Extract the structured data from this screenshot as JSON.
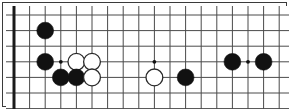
{
  "figure": {
    "kind": "go-board-diagram",
    "caption": ""
  },
  "canvas": {
    "width": 290,
    "height": 111,
    "background_color": "#ffffff",
    "frame_color": "#3a3a3a",
    "frame_width": 1
  },
  "board": {
    "line_color": "#4a4a4a",
    "line_width": 1,
    "edge_color": "#1a1a1a",
    "edge_width": 3,
    "cell_size": 15.6,
    "origin_x": 11,
    "origin_y": 12,
    "columns": 18,
    "rows": 6,
    "edges_shown": [
      "left",
      "bottom"
    ],
    "left_edge_label": "board left edge",
    "bottom_edge_label": "board bottom edge"
  },
  "stones": {
    "black_color": "#111111",
    "white_color": "#ffffff",
    "white_outline_color": "#2a2a2a",
    "radius": 8.4,
    "items": [
      {
        "color": "black",
        "col": 2,
        "row": 1,
        "label": "black-stone-1"
      },
      {
        "color": "black",
        "col": 2,
        "row": 3,
        "label": "black-stone-2"
      },
      {
        "color": "white",
        "col": 4,
        "row": 3,
        "label": "white-stone-1"
      },
      {
        "color": "white",
        "col": 5,
        "row": 3,
        "label": "white-stone-2"
      },
      {
        "color": "black",
        "col": 3,
        "row": 4,
        "label": "black-stone-3"
      },
      {
        "color": "black",
        "col": 4,
        "row": 4,
        "label": "black-stone-4"
      },
      {
        "color": "white",
        "col": 5,
        "row": 4,
        "label": "white-stone-3"
      },
      {
        "color": "white",
        "col": 9,
        "row": 4,
        "label": "white-stone-4"
      },
      {
        "color": "black",
        "col": 11,
        "row": 4,
        "label": "black-stone-5"
      },
      {
        "color": "black",
        "col": 14,
        "row": 3,
        "label": "black-stone-6"
      },
      {
        "color": "black",
        "col": 16,
        "row": 3,
        "label": "black-stone-7"
      }
    ]
  },
  "star_points": {
    "color": "#111111",
    "radius": 1.9,
    "items": [
      {
        "col": 3,
        "row": 3,
        "label": "star-point-left"
      },
      {
        "col": 9,
        "row": 3,
        "label": "star-point-center"
      },
      {
        "col": 15,
        "row": 3,
        "label": "star-point-right"
      }
    ]
  },
  "chart_data": {
    "type": "table",
    "xlabel": "board column",
    "ylabel": "board row",
    "grid": true,
    "legend": [
      "black stone",
      "white stone",
      "star point"
    ],
    "columns": [
      "element",
      "color",
      "col",
      "row"
    ],
    "rows": [
      [
        "stone",
        "black",
        2,
        1
      ],
      [
        "stone",
        "black",
        2,
        3
      ],
      [
        "stone",
        "white",
        4,
        3
      ],
      [
        "stone",
        "white",
        5,
        3
      ],
      [
        "stone",
        "black",
        3,
        4
      ],
      [
        "stone",
        "black",
        4,
        4
      ],
      [
        "stone",
        "white",
        5,
        4
      ],
      [
        "stone",
        "white",
        9,
        4
      ],
      [
        "stone",
        "black",
        11,
        4
      ],
      [
        "stone",
        "black",
        14,
        3
      ],
      [
        "stone",
        "black",
        16,
        3
      ],
      [
        "star",
        "black",
        3,
        3
      ],
      [
        "star",
        "black",
        9,
        3
      ],
      [
        "star",
        "black",
        15,
        3
      ]
    ]
  }
}
